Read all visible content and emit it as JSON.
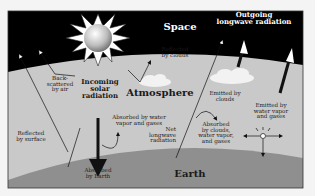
{
  "diagram": {
    "regions": {
      "space": "Space",
      "atmosphere": "Atmosphere",
      "earth": "Earth"
    },
    "labels": {
      "outgoing": "Outgoing\nlongwave radiation",
      "reflected_clouds": "Reflected\nby clouds",
      "back_scattered": "Back-\nscattered\nby air",
      "incoming_solar": "Incoming\nsolar\nradiation",
      "reflected_surface": "Reflected\nby surface",
      "absorbed_water": "Absorbed by water\nvapor and gases",
      "absorbed_earth": "Absorbed\nby Earth",
      "net_longwave": "Net\nlongwave\nradiation",
      "emitted_clouds": "Emitted by\nclouds",
      "absorbed_clouds": "Absorbed\nby clouds,\nwater vapor,\nand gases",
      "emitted_water": "Emitted by\nwater vapor\nand gases"
    },
    "colors": {
      "space": "#000000",
      "atmosphere": "#c9c9c9",
      "earth": "#8f8f8f",
      "frame": "#333333",
      "background": "#f4f4f4"
    }
  }
}
